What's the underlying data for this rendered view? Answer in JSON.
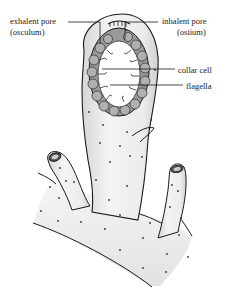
{
  "diagram": {
    "labels": {
      "exhalent_pore": "exhalent pore",
      "exhalent_pore_alt": "(osculum)",
      "inhalent_pore": "inhalent pore",
      "inhalent_pore_alt": "(ostium)",
      "collar_cell": "collar cell",
      "flagella": "flagella"
    },
    "colors": {
      "outline": "#1a1a1a",
      "body_fill": "#f2f2f2",
      "body_shade": "#d9d9d9",
      "cell_fill": "#8c8c8c",
      "cell_light": "#b5b5b5",
      "cavity": "#ffffff"
    }
  }
}
